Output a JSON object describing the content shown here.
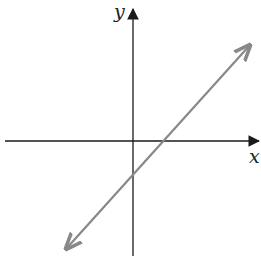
{
  "diagram": {
    "type": "coordinate-plane-with-line",
    "axes": {
      "x_label": "x",
      "y_label": "y",
      "origin_px": [
        133,
        141
      ],
      "x_axis": {
        "x1": 5,
        "x2": 260,
        "y": 141
      },
      "y_axis": {
        "x": 133,
        "y1": 8,
        "y2": 256
      },
      "axis_color": "#1a1a1a"
    },
    "line": {
      "description": "Line with positive slope, positive x-intercept, negative y-intercept, arrows on both ends",
      "start_px": [
        65,
        250
      ],
      "end_px": [
        251,
        44
      ],
      "x_intercept_px": [
        163,
        141
      ],
      "y_intercept_px": [
        133,
        178
      ],
      "color": "#888888"
    }
  }
}
